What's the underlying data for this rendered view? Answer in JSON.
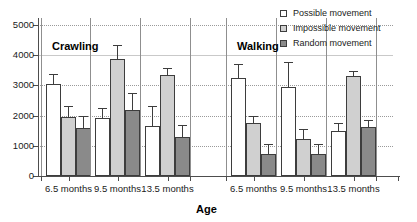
{
  "chart_data": {
    "type": "bar",
    "title": "",
    "xlabel": "Age",
    "ylabel": "",
    "ylim": [
      0,
      5400
    ],
    "yticks": [
      0,
      1000,
      2000,
      3000,
      4000,
      5000
    ],
    "grid": true,
    "legend_position": "top-right",
    "panels": [
      {
        "name": "Crawling",
        "categories": [
          "6.5 months",
          "9.5 months",
          "13.5 months"
        ],
        "series": [
          {
            "name": "Possible movement",
            "values": [
              3050,
              1920,
              1650
            ],
            "errors": [
              330,
              320,
              660
            ]
          },
          {
            "name": "Impossible movement",
            "values": [
              1950,
              3870,
              3340
            ],
            "errors": [
              370,
              480,
              250
            ]
          },
          {
            "name": "Random movement",
            "values": [
              1590,
              2170,
              1290
            ],
            "errors": [
              400,
              590,
              390
            ]
          }
        ]
      },
      {
        "name": "Walking",
        "categories": [
          "6.5 months",
          "9.5 months",
          "13.5 months"
        ],
        "series": [
          {
            "name": "Possible movement",
            "values": [
              3230,
              2950,
              1490
            ],
            "errors": [
              470,
              820,
              260
            ]
          },
          {
            "name": "Impossible movement",
            "values": [
              1740,
              1230,
              3300
            ],
            "errors": [
              240,
              330,
              180
            ]
          },
          {
            "name": "Random movement",
            "values": [
              720,
              730,
              1630
            ],
            "errors": [
              330,
              340,
              220
            ]
          }
        ]
      }
    ]
  },
  "legend": {
    "items": [
      {
        "label": "Possible movement",
        "key": "possible",
        "color": "#ffffff"
      },
      {
        "label": "Impossible movement",
        "key": "impossible",
        "color": "#d0d0d0"
      },
      {
        "label": "Random movement",
        "key": "random",
        "color": "#8a8a8a"
      }
    ]
  },
  "axis": {
    "x_title": "Age",
    "y_tick_labels": [
      "5000",
      "4000",
      "3000",
      "2000",
      "1000",
      "0"
    ]
  },
  "panel_titles": {
    "left": "Crawling",
    "right": "Walking"
  }
}
